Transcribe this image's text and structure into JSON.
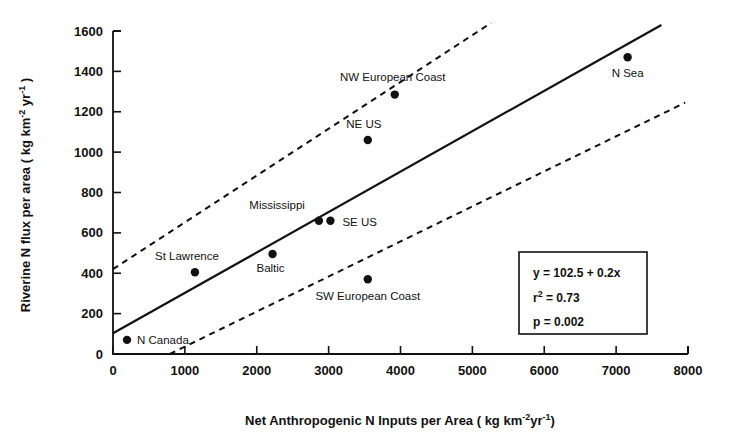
{
  "chart_data": {
    "type": "scatter",
    "title": "",
    "xlabel": "Net Anthropogenic N Inputs per Area ( kg km -2 yr -1 )",
    "xlabel_parts": {
      "main": "Net Anthropogenic N Inputs per Area ( kg km",
      "sup1": "-2",
      "mid": "yr",
      "sup2": "-1",
      "tail": ")"
    },
    "ylabel": "Riverine N  flux per area  ( kg km -2 yr -1 )",
    "ylabel_parts": {
      "main": "Riverine  N   flux per area  ( kg km",
      "sup1": "-2",
      "mid": " yr",
      "sup2": "-1",
      "tail": " )"
    },
    "xlim": [
      0,
      8000
    ],
    "ylim": [
      0,
      1600
    ],
    "xticks": [
      0,
      1000,
      2000,
      3000,
      4000,
      5000,
      6000,
      7000,
      8000
    ],
    "xtick_labels": [
      "0",
      "1000",
      "2000",
      "3000",
      "4000",
      "5000",
      "6000",
      "7000",
      "8000"
    ],
    "yticks": [
      0,
      200,
      400,
      600,
      800,
      1000,
      1200,
      1400,
      1600
    ],
    "ytick_labels": [
      "0",
      "200",
      "400",
      "600",
      "800",
      "1000",
      "1200",
      "1400",
      "1600"
    ],
    "grid": false,
    "legend": "none",
    "points": [
      {
        "label": "N Canada",
        "x": 195,
        "y": 70,
        "label_dx": 10,
        "label_dy": 4,
        "anchor": "start"
      },
      {
        "label": "St Lawrence",
        "x": 1140,
        "y": 405,
        "label_dx": -8,
        "label_dy": -12,
        "anchor": "middle"
      },
      {
        "label": "Baltic",
        "x": 2220,
        "y": 495,
        "label_dx": -2,
        "label_dy": 18,
        "anchor": "middle"
      },
      {
        "label": "Mississippi",
        "x": 2865,
        "y": 660,
        "label_dx": -14,
        "label_dy": -12,
        "anchor": "end"
      },
      {
        "label": "SE US",
        "x": 3025,
        "y": 660,
        "label_dx": 12,
        "label_dy": 5,
        "anchor": "start"
      },
      {
        "label": "SW European Coast",
        "x": 3545,
        "y": 370,
        "label_dx": 0,
        "label_dy": 21,
        "anchor": "middle"
      },
      {
        "label": "NE US",
        "x": 3545,
        "y": 1060,
        "label_dx": -4,
        "label_dy": -12,
        "anchor": "middle"
      },
      {
        "label": "NW European Coast",
        "x": 3920,
        "y": 1285,
        "label_dx": -2,
        "label_dy": -14,
        "anchor": "middle"
      },
      {
        "label": "N Sea",
        "x": 7160,
        "y": 1470,
        "label_dx": 0,
        "label_dy": 20,
        "anchor": "middle"
      }
    ],
    "regression_line": {
      "intercept": 102.5,
      "slope": 0.2,
      "x_start": 0,
      "x_end": 7630,
      "y_start": 102.5,
      "y_end": 1630
    },
    "confidence_upper": {
      "x_start": 0,
      "y_start": 420,
      "x_end": 5260,
      "y_end": 1640
    },
    "confidence_lower": {
      "x_start": 790,
      "y_start": 0,
      "x_end": 7960,
      "y_end": 1245
    },
    "stats_box": {
      "equation_main": "y = 102.5 + 0.2x",
      "r2_symbol": "r",
      "r2_sup": "2",
      "r2_value": "= 0.73",
      "p_value": "p = 0.002"
    }
  },
  "colors": {
    "ink": "#111111",
    "background": "#ffffff"
  }
}
